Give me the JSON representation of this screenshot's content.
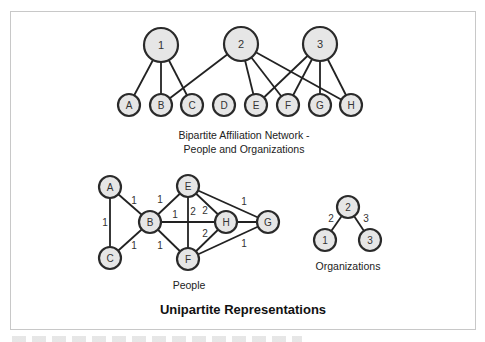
{
  "bipartite": {
    "caption_line1": "Bipartite Affiliation Network -",
    "caption_line2": "People and Organizations",
    "organizations": [
      {
        "id": "1",
        "label": "1",
        "x": 161,
        "y": 45
      },
      {
        "id": "2",
        "label": "2",
        "x": 241,
        "y": 44
      },
      {
        "id": "3",
        "label": "3",
        "x": 320,
        "y": 44
      }
    ],
    "people": [
      {
        "id": "A",
        "label": "A",
        "x": 129,
        "y": 105
      },
      {
        "id": "B",
        "label": "B",
        "x": 161,
        "y": 105
      },
      {
        "id": "C",
        "label": "C",
        "x": 192,
        "y": 105
      },
      {
        "id": "D",
        "label": "D",
        "x": 224,
        "y": 105
      },
      {
        "id": "E",
        "label": "E",
        "x": 256,
        "y": 105
      },
      {
        "id": "F",
        "label": "F",
        "x": 288,
        "y": 105
      },
      {
        "id": "G",
        "label": "G",
        "x": 320,
        "y": 105
      },
      {
        "id": "H",
        "label": "H",
        "x": 351,
        "y": 105
      }
    ],
    "edges": [
      [
        "1",
        "A"
      ],
      [
        "1",
        "B"
      ],
      [
        "1",
        "C"
      ],
      [
        "2",
        "B"
      ],
      [
        "2",
        "E"
      ],
      [
        "2",
        "F"
      ],
      [
        "2",
        "H"
      ],
      [
        "3",
        "E"
      ],
      [
        "3",
        "F"
      ],
      [
        "3",
        "G"
      ],
      [
        "3",
        "H"
      ]
    ]
  },
  "people_graph": {
    "caption": "People",
    "nodes": [
      {
        "id": "A",
        "label": "A",
        "x": 110,
        "y": 187
      },
      {
        "id": "B",
        "label": "B",
        "x": 150,
        "y": 222
      },
      {
        "id": "C",
        "label": "C",
        "x": 110,
        "y": 258
      },
      {
        "id": "E",
        "label": "E",
        "x": 188,
        "y": 186
      },
      {
        "id": "F",
        "label": "F",
        "x": 188,
        "y": 259
      },
      {
        "id": "H",
        "label": "H",
        "x": 226,
        "y": 222
      },
      {
        "id": "G",
        "label": "G",
        "x": 268,
        "y": 222
      }
    ],
    "edges": [
      {
        "from": "A",
        "to": "B",
        "weight": "1",
        "lx": 134,
        "ly": 200
      },
      {
        "from": "A",
        "to": "C",
        "weight": "1",
        "lx": 105,
        "ly": 222
      },
      {
        "from": "B",
        "to": "C",
        "weight": "1",
        "lx": 134,
        "ly": 245
      },
      {
        "from": "B",
        "to": "E",
        "weight": "1",
        "lx": 160,
        "ly": 199
      },
      {
        "from": "B",
        "to": "F",
        "weight": "1",
        "lx": 160,
        "ly": 245
      },
      {
        "from": "B",
        "to": "H",
        "weight": "1",
        "lx": 175,
        "ly": 214
      },
      {
        "from": "E",
        "to": "F",
        "weight": "2",
        "lx": 193,
        "ly": 211
      },
      {
        "from": "E",
        "to": "H",
        "weight": "2",
        "lx": 205,
        "ly": 210
      },
      {
        "from": "F",
        "to": "H",
        "weight": "2",
        "lx": 205,
        "ly": 233
      },
      {
        "from": "E",
        "to": "G",
        "weight": "1",
        "lx": 244,
        "ly": 201
      },
      {
        "from": "F",
        "to": "G",
        "weight": "1",
        "lx": 244,
        "ly": 243
      },
      {
        "from": "H",
        "to": "G",
        "weight": "",
        "lx": 0,
        "ly": 0
      }
    ]
  },
  "org_graph": {
    "caption": "Organizations",
    "nodes": [
      {
        "id": "2",
        "label": "2",
        "x": 348,
        "y": 207
      },
      {
        "id": "1",
        "label": "1",
        "x": 325,
        "y": 240
      },
      {
        "id": "3",
        "label": "3",
        "x": 370,
        "y": 240
      }
    ],
    "edges": [
      {
        "from": "2",
        "to": "1",
        "weight": "2",
        "lx": 331,
        "ly": 218
      },
      {
        "from": "2",
        "to": "3",
        "weight": "3",
        "lx": 366,
        "ly": 218
      }
    ]
  },
  "title": "Unipartite Representations"
}
